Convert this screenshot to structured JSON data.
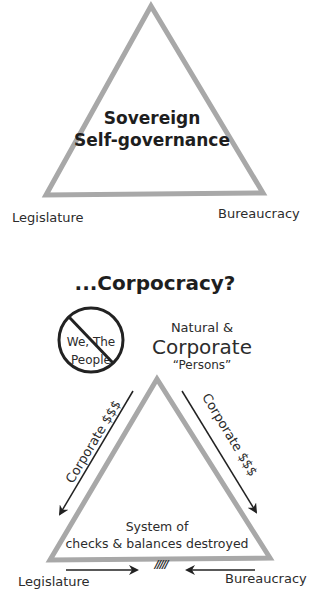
{
  "top_diagram": {
    "center_line1": "Sovereign",
    "center_line2": "Self-governance",
    "left_label": "Legislature",
    "right_label": "Bureaucracy"
  },
  "bottom_diagram": {
    "title": "...Corpocracy?",
    "prohibited_line1": "We, The",
    "prohibited_line2": "People",
    "apex_line1": "Natural &",
    "apex_line2": "Corporate",
    "apex_line3": "“Persons”",
    "left_arrow_label": "Corporate $$$",
    "right_arrow_label": "Corporate $$$",
    "center_line1": "System of",
    "center_line2": "checks & balances destroyed",
    "broken_mark": "/////",
    "left_label": "Legislature",
    "right_label": "Bureaucracy"
  },
  "colors": {
    "triangle_stroke": "#a8a8a8",
    "text": "#2c2c2c",
    "arrow": "#222222"
  }
}
